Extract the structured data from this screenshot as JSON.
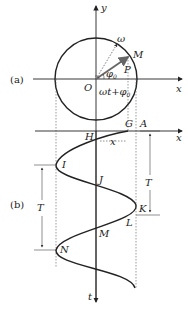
{
  "figure": {
    "panel_a": {
      "label": "(a)",
      "axis_x": "x",
      "axis_y": "y",
      "origin": "O",
      "point_M": "M",
      "point_P": "P",
      "angular_velocity": "ω",
      "initial_phase": "φ",
      "initial_phase_sub": "0",
      "phase_expr_main": "ωt+φ",
      "phase_expr_sub": "0"
    },
    "panel_b": {
      "label": "(b)",
      "axis_x": "x",
      "axis_t": "t",
      "points": [
        "G",
        "A",
        "H",
        "I",
        "J",
        "K",
        "L",
        "M",
        "N"
      ],
      "point_G": "G",
      "point_A": "A",
      "point_H": "H",
      "point_I": "I",
      "point_J": "J",
      "point_K": "K",
      "point_L": "L",
      "point_M": "M",
      "point_N": "N",
      "displacement": "x",
      "period_right": "T",
      "period_left": "T"
    }
  }
}
